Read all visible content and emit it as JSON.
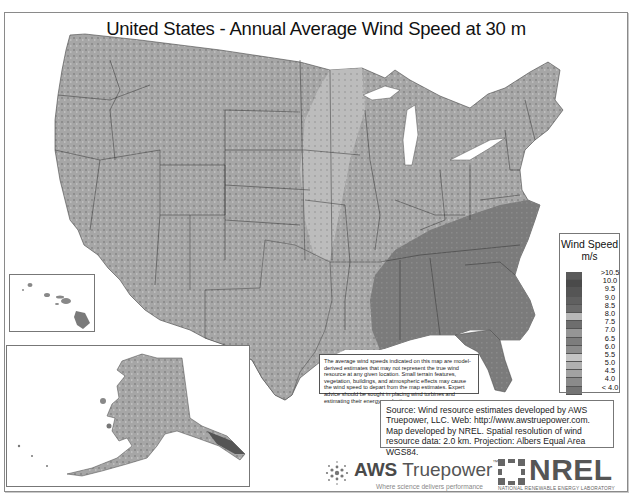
{
  "title": "United States - Annual Average Wind Speed at 30 m",
  "legend": {
    "title": "Wind Speed",
    "unit": "m/s",
    "items": [
      {
        "label": ">10.5",
        "color": "#5a5a5a"
      },
      {
        "label": "10.0",
        "color": "#4a4a4a"
      },
      {
        "label": "9.5",
        "color": "#555555"
      },
      {
        "label": "9.0",
        "color": "#606060"
      },
      {
        "label": "8.5",
        "color": "#6b6b6b"
      },
      {
        "label": "8.0",
        "color": "#b8b8b8"
      },
      {
        "label": "7.5",
        "color": "#6e6e6e"
      },
      {
        "label": "7.0",
        "color": "#959595"
      },
      {
        "label": "6.5",
        "color": "#7d7d7d"
      },
      {
        "label": "6.0",
        "color": "#8c8c8c"
      },
      {
        "label": "5.5",
        "color": "#c4c4c4"
      },
      {
        "label": "5.0",
        "color": "#b0b0b0"
      },
      {
        "label": "4.5",
        "color": "#a2a2a2"
      },
      {
        "label": "4.0",
        "color": "#8a8a8a"
      },
      {
        "label": "< 4.0",
        "color": "#747474"
      }
    ]
  },
  "disclaimer": "The average wind speeds indicated on this map are model-derived estimates that may not represent the true wind resource at any given location. Small terrain features, vegetation, buildings, and atmospheric effects may cause the wind speed to depart from the map estimates. Expert advice should be sought in placing wind turbines and estimating their energy production.",
  "source": "Source: Wind resource estimates developed by AWS Truepower, LLC. Web: http://www.awstruepower.com. Map developed by NREL. Spatial resolution of wind resource data: 2.0 km. Projection: Albers Equal Area WGS84.",
  "logos": {
    "aws_bold": "AWS",
    "aws_light": " Truepower",
    "aws_tm": "™",
    "aws_tagline": "Where science delivers performance",
    "nrel_name": "NREL",
    "nrel_tagline": "NATIONAL RENEWABLE ENERGY LABORATORY"
  },
  "insets": [
    "Hawaii",
    "Alaska"
  ]
}
